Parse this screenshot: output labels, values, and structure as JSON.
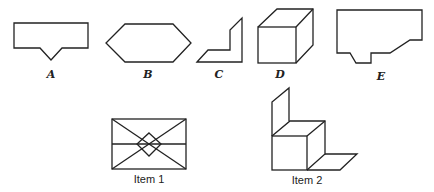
{
  "figure": {
    "options": [
      {
        "label": "A",
        "shape": "rectangle-with-v-notch"
      },
      {
        "label": "B",
        "shape": "hexagon"
      },
      {
        "label": "C",
        "shape": "L-shaped-folded-strip"
      },
      {
        "label": "D",
        "shape": "cube"
      },
      {
        "label": "E",
        "shape": "irregular-polygon-with-notch"
      }
    ],
    "items": [
      {
        "label": "Item 1",
        "shape": "rectangle-with-diagonals-and-diamond"
      },
      {
        "label": "Item 2",
        "shape": "cube-with-back-panel-and-floor-panel"
      }
    ],
    "colors": {
      "stroke": "#222222",
      "background": "#ffffff"
    }
  }
}
